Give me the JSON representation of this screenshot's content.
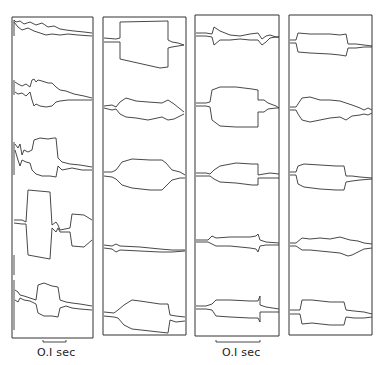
{
  "figure": {
    "panels": [
      {
        "id": 1,
        "traces": 5
      },
      {
        "id": 2,
        "traces": 5
      },
      {
        "id": 3,
        "traces": 5
      },
      {
        "id": 4,
        "traces": 5
      }
    ],
    "scale_bars": [
      {
        "label": "O.I sec",
        "under_panel": 1
      },
      {
        "label": "O.I sec",
        "under_panel": 3
      }
    ],
    "colors": {
      "ink": "#333333",
      "background": "#ffffff"
    }
  }
}
